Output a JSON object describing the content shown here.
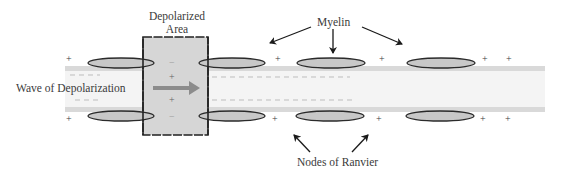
{
  "labels": {
    "depolarized_area_line1": "Depolarized",
    "depolarized_area_line2": "Area",
    "myelin": "Myelin",
    "wave_of_depolarization": "Wave of Depolarization",
    "nodes_of_ranvier": "Nodes of Ranvier"
  },
  "signs": {
    "plus": "+",
    "minus": "−"
  },
  "colors": {
    "axon_border": "#d9d9d9",
    "axon_fill": "#f4f4f4",
    "myelin_fill": "#c8c8c8",
    "myelin_stroke": "#2a2a2a",
    "depolarized_fill": "#d6d6d6",
    "arrow": "#8c8c8c",
    "text": "#3a3a3a"
  },
  "diagram": {
    "myelin_sheaths_top_x": [
      118,
      232,
      331,
      441
    ],
    "myelin_sheaths_bottom_x": [
      118,
      232,
      330,
      440
    ],
    "plus_top_x": [
      70,
      278,
      382,
      485,
      508
    ],
    "plus_bottom_x": [
      70,
      275,
      379,
      483,
      508
    ]
  }
}
